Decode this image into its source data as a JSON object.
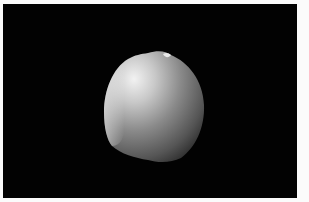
{
  "image": {
    "description": "Grayscale rendering of a rounded seed-like object on a black background",
    "background_color": "#020202",
    "border_color": "#fbfbfb",
    "object_highlight_color": "#f0f0f0",
    "object_shadow_color": "#2a2a2a"
  }
}
